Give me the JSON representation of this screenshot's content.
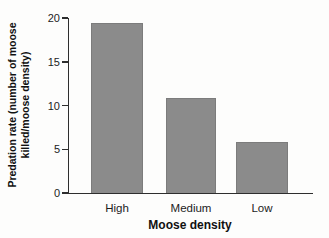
{
  "chart_data": {
    "type": "bar",
    "categories": [
      "High",
      "Medium",
      "Low"
    ],
    "values": [
      19.4,
      10.9,
      5.8
    ],
    "title": "",
    "xlabel": "Moose density",
    "ylabel": "Predation rate (number of moose killed/moose density)",
    "ylim": [
      0,
      20
    ],
    "yticks": [
      0,
      5,
      10,
      15,
      20
    ],
    "bar_color": "#8b8b8b",
    "bar_edge_color": "#7c7c7c",
    "axis_color": "#2e2e2e",
    "background_color": "#fdfdfc",
    "grid": false,
    "legend": false
  }
}
